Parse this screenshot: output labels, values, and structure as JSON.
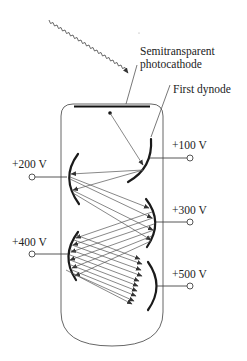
{
  "diagram": {
    "labels": {
      "photocathode_line1": "Semitransparent",
      "photocathode_line2": "photocathode",
      "first_dynode": "First dynode"
    },
    "dynodes": [
      {
        "index": 1,
        "voltage": "+100 V",
        "side": "right"
      },
      {
        "index": 2,
        "voltage": "+200 V",
        "side": "left"
      },
      {
        "index": 3,
        "voltage": "+300 V",
        "side": "right"
      },
      {
        "index": 4,
        "voltage": "+400 V",
        "side": "left"
      },
      {
        "index": 5,
        "voltage": "+500 V",
        "side": "right"
      }
    ],
    "elements": {
      "incident_photon": "wavy photon arrow entering top of tube",
      "photocathode": "horizontal bar at top inside tube",
      "electron_trajectories": "arrows cascading between dynodes"
    },
    "colors": {
      "line": "#444444",
      "dynode": "#1a1a1a",
      "background": "#ffffff"
    }
  }
}
